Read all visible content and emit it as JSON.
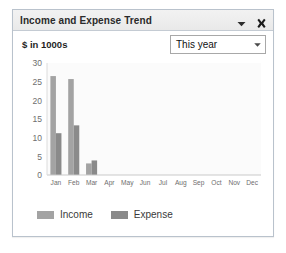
{
  "widget": {
    "title": "Income and Expense Trend",
    "units_label": "$ in 1000s",
    "collapse_icon": "chevron-down-icon",
    "close_icon": "close-icon"
  },
  "range_filter": {
    "selected": "This year",
    "arrow_icon": "chevron-down-icon",
    "options": [
      "This year"
    ]
  },
  "colors": {
    "income": "#a3a3a3",
    "expense": "#8a8a8a",
    "panel_border": "#b9c2cc",
    "titlebar_bg": "#eeeeee",
    "plot_bg": "#fbfbfb",
    "axis_text": "#6e6e6e"
  },
  "chart_data": {
    "type": "bar",
    "title": "Income and Expense Trend",
    "xlabel": "",
    "ylabel": "$ in 1000s",
    "ylim": [
      0,
      30
    ],
    "yticks": [
      0,
      5,
      10,
      15,
      20,
      25,
      30
    ],
    "grid": false,
    "legend_position": "bottom-left",
    "categories": [
      "Jan",
      "Feb",
      "Mar",
      "Apr",
      "May",
      "Jun",
      "Jul",
      "Aug",
      "Sep",
      "Oct",
      "Nov",
      "Dec"
    ],
    "series": [
      {
        "name": "Income",
        "color": "#a3a3a3",
        "values": [
          26.5,
          25.7,
          3.1,
          0,
          0,
          0,
          0,
          0,
          0,
          0,
          0,
          0
        ]
      },
      {
        "name": "Expense",
        "color": "#8a8a8a",
        "values": [
          11.2,
          13.3,
          3.9,
          0,
          0,
          0,
          0,
          0,
          0,
          0,
          0,
          0
        ]
      }
    ]
  }
}
